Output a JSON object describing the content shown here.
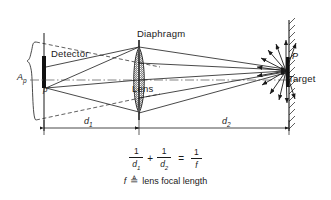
{
  "diagram": {
    "labels": {
      "detector": "Detector",
      "diaphragm": "Diaphragm",
      "lens": "Lens",
      "target": "Target",
      "aperture_area": "A",
      "aperture_area_sub": "p",
      "source_point": "p'",
      "target_point": "P",
      "distance_1": "d",
      "distance_1_sub": "1",
      "distance_2": "d",
      "distance_2_sub": "2"
    },
    "equation": {
      "num_1": "1",
      "den_1": "d",
      "den_1_sub": "1",
      "plus": "+",
      "num_2": "1",
      "den_2": "d",
      "den_2_sub": "2",
      "equals": "=",
      "num_3": "1",
      "den_3": "f"
    },
    "definition": {
      "symbol": "f",
      "operator": "≜",
      "text": "lens focal length"
    },
    "colors": {
      "ink": "#1a1a1a",
      "background": "#ffffff",
      "solid_part": "#111111"
    }
  }
}
